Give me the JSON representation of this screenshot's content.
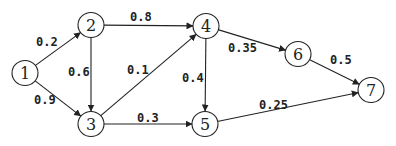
{
  "diagram": {
    "type": "directed-weighted-graph",
    "nodes": [
      {
        "id": "1",
        "label": "1",
        "x": 25,
        "y": 73
      },
      {
        "id": "2",
        "label": "2",
        "x": 91,
        "y": 25
      },
      {
        "id": "3",
        "label": "3",
        "x": 91,
        "y": 124
      },
      {
        "id": "4",
        "label": "4",
        "x": 206,
        "y": 26
      },
      {
        "id": "5",
        "label": "5",
        "x": 205,
        "y": 124
      },
      {
        "id": "6",
        "label": "6",
        "x": 298,
        "y": 54
      },
      {
        "id": "7",
        "label": "7",
        "x": 371,
        "y": 90
      }
    ],
    "edges": [
      {
        "from": "1",
        "to": "2",
        "weight": "0.2",
        "lx": 36,
        "ly": 46
      },
      {
        "from": "1",
        "to": "3",
        "weight": "0.9",
        "lx": 34,
        "ly": 104
      },
      {
        "from": "2",
        "to": "4",
        "weight": "0.8",
        "lx": 130,
        "ly": 21
      },
      {
        "from": "2",
        "to": "3",
        "weight": "0.6",
        "lx": 68,
        "ly": 76
      },
      {
        "from": "3",
        "to": "4",
        "weight": "0.1",
        "lx": 127,
        "ly": 74
      },
      {
        "from": "3",
        "to": "5",
        "weight": "0.3",
        "lx": 137,
        "ly": 122
      },
      {
        "from": "4",
        "to": "5",
        "weight": "0.4",
        "lx": 182,
        "ly": 82
      },
      {
        "from": "4",
        "to": "6",
        "weight": "0.35",
        "lx": 228,
        "ly": 52
      },
      {
        "from": "6",
        "to": "7",
        "weight": "0.5",
        "lx": 330,
        "ly": 64
      },
      {
        "from": "5",
        "to": "7",
        "weight": "0.25",
        "lx": 259,
        "ly": 109
      }
    ]
  }
}
